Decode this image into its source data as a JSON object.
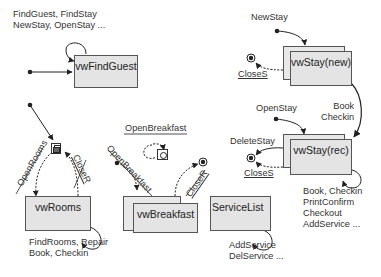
{
  "diagram": {
    "type": "window navigation state diagram",
    "windows": {
      "find_guest": {
        "label": "vwFindGuest"
      },
      "rooms": {
        "label": "vwRooms"
      },
      "breakfast": {
        "label": "vwBreakfast"
      },
      "service_list": {
        "label": "ServiceList"
      },
      "stay_new": {
        "label": "vwStay(new)"
      },
      "stay_rec": {
        "label": "vwStay(rec)"
      }
    },
    "find_guest_actions": [
      "FindGuest, FindStay",
      "NewStay, OpenStay ..."
    ],
    "rooms_actions": [
      "FindRooms, Repair",
      "Book, Checkin"
    ],
    "service_list_actions": [
      "AddService",
      "DelService ..."
    ],
    "stay_rec_actions": [
      "Book, Checkin",
      "PrintConfirm",
      "Checkout",
      "AddService ..."
    ],
    "transitions": {
      "new_stay": "NewStay",
      "close_s_new": "CloseS",
      "book_checkin": [
        "Book",
        "Checkin"
      ],
      "open_stay": "OpenStay",
      "delete_stay": "DeleteStay",
      "close_s_rec": "CloseS",
      "open_rooms": "OpenRooms",
      "close_r_rooms": "CloseR",
      "open_breakfast_top": "OpenBreakfast",
      "open_breakfast_diag": "OpenBreakfast",
      "close_r_breakfast": "CloseR"
    },
    "icons": {
      "rooms_icon": "overlapping-windows-icon",
      "breakfast_icon": "breakfast-window-icon",
      "start": "start-dot-icon",
      "end": "end-state-icon"
    },
    "colors": {
      "box_fill": "#e4e4e4",
      "line": "#222222",
      "text": "#333333"
    }
  }
}
